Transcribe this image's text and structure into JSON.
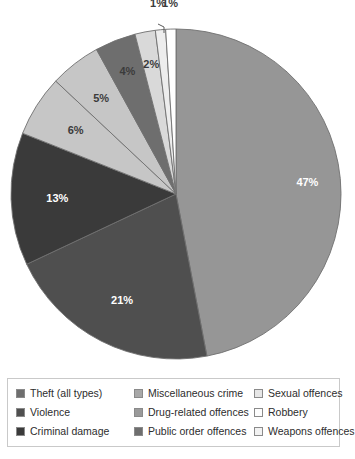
{
  "chart_data": {
    "type": "pie",
    "title": "",
    "subtitle": "",
    "xlabel": "",
    "ylabel": "",
    "legend_position": "bottom",
    "grid": false,
    "start_angle_deg": 0,
    "direction": "clockwise",
    "units": "percent",
    "categories": [
      "Theft (all types)",
      "Violence",
      "Criminal damage",
      "Miscellaneous crime",
      "Drug-related offences",
      "Public order offences",
      "Sexual offences",
      "Robbery",
      "Weapons offences"
    ],
    "values": [
      47,
      21,
      13,
      6,
      5,
      4,
      2,
      1,
      1
    ],
    "data_labels": [
      "47%",
      "21%",
      "13%",
      "6%",
      "5%",
      "4%",
      "2%",
      "1%",
      "1%"
    ],
    "colors": [
      "#969696",
      "#4f4f4f",
      "#3a3a3a",
      "#c6c6c6",
      "#c6c6c6",
      "#6e6e6e",
      "#d9d9d9",
      "#ededed",
      "#ffffff"
    ],
    "slice_border_color": "#6f6f6f",
    "slices": [
      {
        "label": "Theft (all types)",
        "value": 47,
        "display": "47%",
        "color": "#969696",
        "label_color": "#ffffff",
        "swatch": "#6e6e6e"
      },
      {
        "label": "Violence",
        "value": 21,
        "display": "21%",
        "color": "#4f4f4f",
        "label_color": "#ffffff",
        "swatch": "#4f4f4f"
      },
      {
        "label": "Criminal damage",
        "value": 13,
        "display": "13%",
        "color": "#3a3a3a",
        "label_color": "#ffffff",
        "swatch": "#3a3a3a"
      },
      {
        "label": "Miscellaneous crime",
        "value": 6,
        "display": "6%",
        "color": "#c6c6c6",
        "label_color": "#3b3b3b",
        "swatch": "#a8a8a8"
      },
      {
        "label": "Drug-related offences",
        "value": 5,
        "display": "5%",
        "color": "#c6c6c6",
        "label_color": "#3b3b3b",
        "swatch": "#9a9a9a"
      },
      {
        "label": "Public order offences",
        "value": 4,
        "display": "4%",
        "color": "#6e6e6e",
        "label_color": "#3b3b3b",
        "swatch": "#6e6e6e"
      },
      {
        "label": "Sexual offences",
        "value": 2,
        "display": "2%",
        "color": "#d9d9d9",
        "label_color": "#3b3b3b",
        "swatch": "#e0e0e0"
      },
      {
        "label": "Robbery",
        "value": 1,
        "display": "1%",
        "color": "#ededed",
        "label_color": "#3b3b3b",
        "swatch": "#fdfdfd"
      },
      {
        "label": "Weapons offences",
        "value": 1,
        "display": "1%",
        "color": "#ffffff",
        "label_color": "#3b3b3b",
        "swatch": "#f2f2f2"
      }
    ]
  },
  "legend": {
    "columns": [
      [
        {
          "label": "Theft (all types)",
          "swatch": "#6e6e6e"
        },
        {
          "label": "Violence",
          "swatch": "#4f4f4f"
        },
        {
          "label": "Criminal damage",
          "swatch": "#3a3a3a"
        }
      ],
      [
        {
          "label": "Miscellaneous crime",
          "swatch": "#a8a8a8"
        },
        {
          "label": "Drug-related offences",
          "swatch": "#9a9a9a"
        },
        {
          "label": "Public order offences",
          "swatch": "#6e6e6e"
        }
      ],
      [
        {
          "label": "Sexual offences",
          "swatch": "#e6e6e6"
        },
        {
          "label": "Robbery",
          "swatch": "#fdfdfd"
        },
        {
          "label": "Weapons offences",
          "swatch": "#f2f2f2"
        }
      ]
    ]
  }
}
